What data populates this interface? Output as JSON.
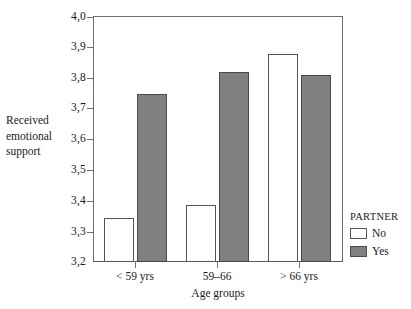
{
  "chart_data": {
    "type": "bar",
    "title": "",
    "xlabel": "Age groups",
    "ylabel": "Received emotional support",
    "ylabel_lines": [
      "Received",
      "emotional",
      "support"
    ],
    "categories": [
      "< 59 yrs",
      "59–66",
      "> 66 yrs"
    ],
    "series": [
      {
        "name": "No",
        "values": [
          3.345,
          3.385,
          3.88
        ]
      },
      {
        "name": "Yes",
        "values": [
          3.75,
          3.82,
          3.81
        ]
      }
    ],
    "ylim": [
      3.2,
      4.0
    ],
    "ytick_labels": [
      "4,0",
      "3,9",
      "3,8",
      "3,7",
      "3,6",
      "3,5",
      "3,4",
      "3,3",
      "3,2"
    ],
    "ytick_values": [
      4.0,
      3.9,
      3.8,
      3.7,
      3.6,
      3.5,
      3.4,
      3.3,
      3.2
    ],
    "grid": false,
    "legend": {
      "title": "PARTNER",
      "position": "right-bottom",
      "entries": [
        {
          "label": "No",
          "color": "#ffffff"
        },
        {
          "label": "Yes",
          "color": "#808080"
        }
      ]
    },
    "colors": {
      "no_fill": "#ffffff",
      "yes_fill": "#808080",
      "bar_outline": "#555555",
      "axis": "#6e6e6e",
      "background": "#ffffff",
      "text": "#1a1a1a"
    }
  }
}
